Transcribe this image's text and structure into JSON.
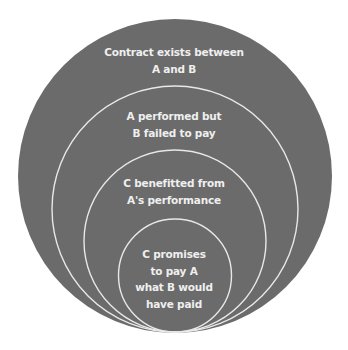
{
  "diagram": {
    "type": "nested-circles",
    "colors": {
      "fill": "#6b6b6b",
      "ring_stroke": "#e8e8e8",
      "text": "#efefef",
      "background": "#ffffff"
    },
    "circles": [
      {
        "level": 1,
        "lines": [
          "Contract exists between",
          "A and B"
        ]
      },
      {
        "level": 2,
        "lines": [
          "A performed but",
          "B failed to pay"
        ]
      },
      {
        "level": 3,
        "lines": [
          "C benefitted from",
          "A's performance"
        ]
      },
      {
        "level": 4,
        "lines": [
          "C promises",
          "to pay A",
          "what B would",
          "have paid"
        ]
      }
    ]
  }
}
